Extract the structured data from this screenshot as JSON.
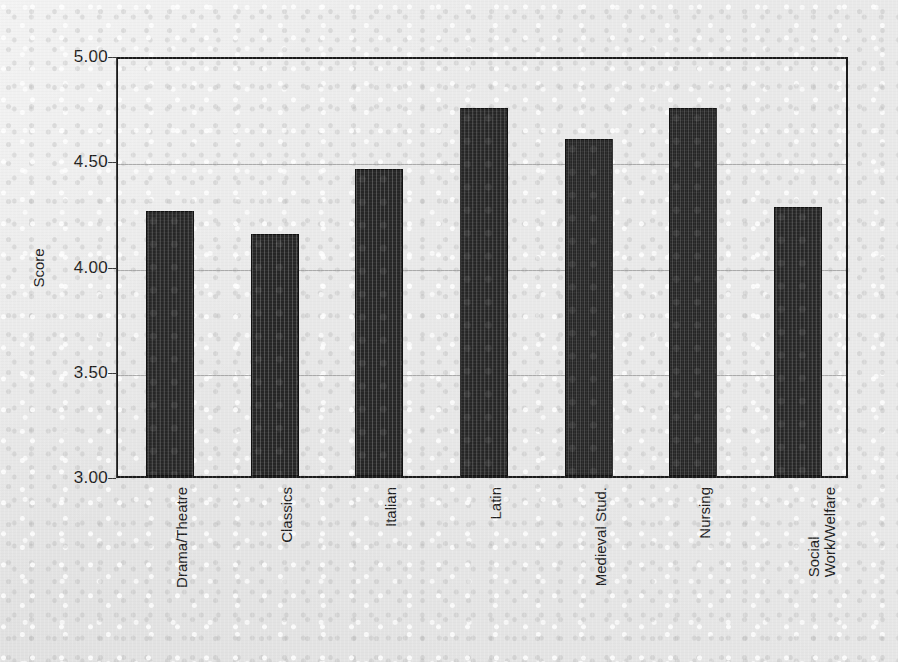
{
  "chart_data": {
    "type": "bar",
    "title": "",
    "xlabel": "",
    "ylabel": "Score",
    "ylim": [
      3.0,
      5.0
    ],
    "y_ticks": [
      "3.00",
      "3.50",
      "4.00",
      "4.50",
      "5.00"
    ],
    "y_tick_values": [
      3.0,
      3.5,
      4.0,
      4.5,
      5.0
    ],
    "grid": true,
    "legend": "none",
    "bar_color": "#262626",
    "categories": [
      "Drama/Theatre",
      "Classics",
      "Italian",
      "Latin",
      "Medieval Stud.",
      "Nursing",
      "Social Work/Welfare"
    ],
    "category_lines": [
      [
        "Drama/Theatre"
      ],
      [
        "Classics"
      ],
      [
        "Italian"
      ],
      [
        "Latin"
      ],
      [
        "Medieval Stud."
      ],
      [
        "Nursing"
      ],
      [
        "Social",
        "Work/Welfare"
      ]
    ],
    "values": [
      4.26,
      4.15,
      4.46,
      4.75,
      4.6,
      4.75,
      4.28
    ]
  }
}
